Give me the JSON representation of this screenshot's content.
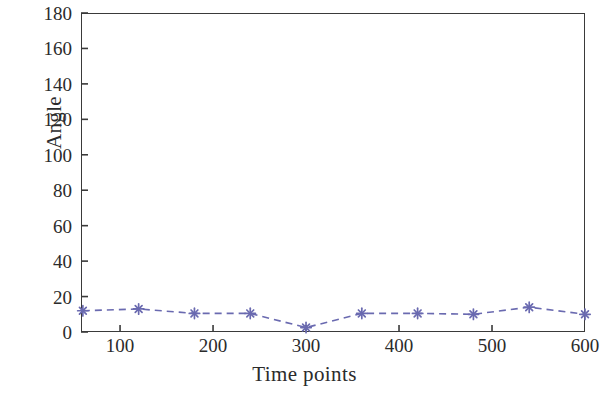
{
  "chart_data": {
    "type": "line",
    "title": "",
    "xlabel": "Time points",
    "ylabel": "Angle",
    "xlim": [
      58,
      600
    ],
    "ylim": [
      0,
      180
    ],
    "xticks": [
      100,
      200,
      300,
      400,
      500,
      600
    ],
    "yticks": [
      0,
      20,
      40,
      60,
      80,
      100,
      120,
      140,
      160,
      180
    ],
    "xtick_labels": [
      "100",
      "200",
      "300",
      "400",
      "500",
      "600"
    ],
    "ytick_labels": [
      "0",
      "20",
      "40",
      "60",
      "80",
      "100",
      "120",
      "140",
      "160",
      "180"
    ],
    "grid": false,
    "legend": null,
    "series": [
      {
        "name": "Angle",
        "color": "#6a6ab0",
        "linestyle": "dashed",
        "marker": "star",
        "x": [
          60,
          120,
          180,
          240,
          300,
          360,
          420,
          480,
          540,
          600
        ],
        "values": [
          12,
          13,
          10.5,
          10.5,
          2.5,
          10.5,
          10.5,
          10,
          14,
          10
        ]
      }
    ]
  },
  "axes": {
    "frame_color": "#3a3a3a"
  }
}
